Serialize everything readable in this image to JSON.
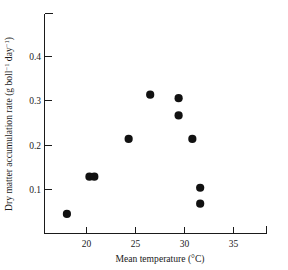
{
  "chart_data": {
    "type": "scatter",
    "title": "",
    "xlabel": "Mean temperature (°C)",
    "ylabel": "Dry matter accumulation rate (g boll⁻¹ day⁻¹)",
    "ylabel_parts": {
      "main": "Dry matter accumulation rate (g boll",
      "sup1": "−1",
      "mid": " day",
      "sup2": "−1",
      "tail": ")"
    },
    "xlim": [
      16.0,
      38.5
    ],
    "ylim": [
      0.0,
      0.465
    ],
    "grid": false,
    "legend": null,
    "xticks": [
      20,
      25,
      30,
      35
    ],
    "xtick_labels": [
      "20",
      "25",
      "30",
      "35"
    ],
    "yticks": [
      0.1,
      0.2,
      0.3,
      0.4
    ],
    "ytick_labels": [
      "0.1",
      "0.2",
      "0.3",
      "0.4"
    ],
    "marker": {
      "shape": "circle",
      "color": "#111111",
      "size_px": 4.6
    },
    "points": [
      {
        "x": 18.0,
        "y": 0.045
      },
      {
        "x": 20.3,
        "y": 0.129
      },
      {
        "x": 20.8,
        "y": 0.129
      },
      {
        "x": 24.3,
        "y": 0.214
      },
      {
        "x": 26.5,
        "y": 0.314
      },
      {
        "x": 29.4,
        "y": 0.306
      },
      {
        "x": 29.4,
        "y": 0.267
      },
      {
        "x": 30.8,
        "y": 0.214
      },
      {
        "x": 31.6,
        "y": 0.104
      },
      {
        "x": 31.6,
        "y": 0.068
      }
    ],
    "series": [
      {
        "name": "Dry matter accumulation rate",
        "x": [
          18.0,
          20.3,
          20.8,
          24.3,
          26.5,
          29.4,
          29.4,
          30.8,
          31.6,
          31.6
        ],
        "values": [
          0.045,
          0.129,
          0.129,
          0.214,
          0.314,
          0.306,
          0.267,
          0.214,
          0.104,
          0.068
        ]
      }
    ]
  },
  "axes": {
    "x_axis_name": "mean-temperature-axis",
    "y_axis_name": "dry-matter-rate-axis"
  }
}
